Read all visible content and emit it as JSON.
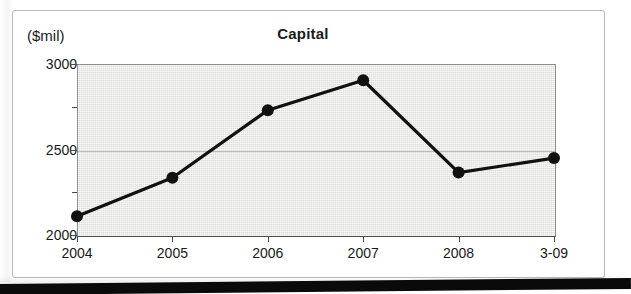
{
  "figure": {
    "title": "Capital",
    "y_axis_unit_label": "($mil)"
  },
  "chart_data": {
    "type": "line",
    "title": "Capital",
    "xlabel": "",
    "ylabel": "($mil)",
    "ylim": [
      2000,
      3000
    ],
    "y_ticks": [
      2000,
      2500,
      3000
    ],
    "y_minor_ticks": [
      2250,
      2750
    ],
    "grid": true,
    "legend": "none",
    "marker": "filled-circle",
    "line_color": "#111111",
    "plot_background": "#dededd",
    "categories": [
      "2004",
      "2005",
      "2006",
      "2007",
      "2008",
      "3-09"
    ],
    "values": [
      2110,
      2335,
      2730,
      2905,
      2365,
      2450
    ],
    "series": [
      {
        "name": "Capital",
        "values": [
          2110,
          2335,
          2730,
          2905,
          2365,
          2450
        ]
      }
    ]
  },
  "y_tick_labels": [
    {
      "value": 3000,
      "label": "3000"
    },
    {
      "value": 2500,
      "label": "2500"
    },
    {
      "value": 2000,
      "label": "2000"
    }
  ],
  "x_tick_labels": [
    {
      "label": "2004"
    },
    {
      "label": "2005"
    },
    {
      "label": "2006"
    },
    {
      "label": "2007"
    },
    {
      "label": "2008"
    },
    {
      "label": "3-09"
    }
  ]
}
